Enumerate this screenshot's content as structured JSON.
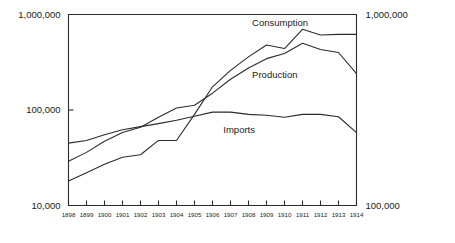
{
  "chart_data": {
    "type": "line",
    "title": "",
    "subtitle": "",
    "xlabel": "",
    "ylabel": "",
    "scale": "log",
    "grid": false,
    "legend_position": "inline-labels",
    "axis": {
      "left_ticks": [
        "1,000,000",
        "100,000",
        "10,000"
      ],
      "left_tick_values": [
        1000000,
        100000,
        10000
      ],
      "right_ticks": [
        "1,000,000",
        "100,000"
      ],
      "right_tick_values": [
        1000000,
        100000
      ],
      "ylim": [
        10000,
        1000000
      ],
      "xlim": [
        1898,
        1914
      ]
    },
    "categories": [
      "1898",
      "1899",
      "1900",
      "1901",
      "1902",
      "1903",
      "1904",
      "1905",
      "1906",
      "1907",
      "1908",
      "1909",
      "1910",
      "1911",
      "1912",
      "1913",
      "1914"
    ],
    "x": [
      1898,
      1899,
      1900,
      1901,
      1902,
      1903,
      1904,
      1905,
      1906,
      1907,
      1908,
      1909,
      1910,
      1911,
      1912,
      1913,
      1914
    ],
    "series": [
      {
        "name": "Consumption",
        "label": "Consumption",
        "label_x": 1908.2,
        "label_y": 760000,
        "values": [
          18000,
          22000,
          27000,
          32000,
          34000,
          48000,
          48000,
          90000,
          175000,
          260000,
          360000,
          480000,
          440000,
          700000,
          610000,
          620000,
          620000
        ]
      },
      {
        "name": "Production",
        "label": "Production",
        "label_x": 1908.2,
        "label_y": 215000,
        "values": [
          29000,
          36000,
          47000,
          58000,
          66000,
          84000,
          105000,
          112000,
          150000,
          210000,
          275000,
          345000,
          390000,
          500000,
          430000,
          400000,
          240000
        ]
      },
      {
        "name": "Imports",
        "label": "Imports",
        "label_x": 1906.6,
        "label_y": 58000,
        "values": [
          45000,
          48000,
          55000,
          62000,
          67000,
          72000,
          78000,
          86000,
          95000,
          95000,
          90000,
          88000,
          84000,
          90000,
          90000,
          85000,
          58000
        ]
      }
    ]
  }
}
